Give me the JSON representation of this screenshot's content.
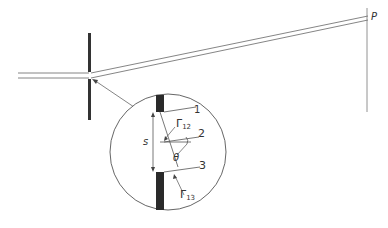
{
  "diagram": {
    "labels": {
      "point": "P",
      "ray1": "1",
      "ray2": "2",
      "ray3": "3",
      "separation": "s",
      "angle": "θ",
      "gamma12": "Γ",
      "gamma12_sub": "12",
      "gamma13": "Γ",
      "gamma13_sub": "13"
    },
    "colors": {
      "line": "#555555",
      "barrier": "#2a2a2a",
      "background": "#ffffff"
    }
  }
}
